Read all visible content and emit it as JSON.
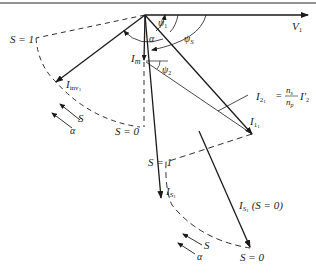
{
  "diagram": {
    "type": "phasor-diagram",
    "colors": {
      "stroke": "#1a1a1a",
      "frame": "#6e6e6e",
      "background": "#ffffff"
    },
    "labels": {
      "v1": "V",
      "v1_sub": "1",
      "s1_top": "S = 1",
      "i_inv": "I",
      "i_inv_sub": "inv",
      "i_inv_sub2": "1",
      "i_m": "I",
      "i_m_sub": "m",
      "alpha_top": "α",
      "psi1": "ψ",
      "psi1_sub": "1",
      "psis": "ψ",
      "psis_sub": "S",
      "psi2": "ψ",
      "psi2_sub": "2",
      "s0_upper": "S = 0",
      "i2_lhs": "I",
      "i2_lhs_sub": "2",
      "i2_lhs_sub2": "1",
      "i2_eq": "=",
      "i2_num": "n",
      "i2_num_sub": "s",
      "i2_den": "n",
      "i2_den_sub": "p",
      "i2_rhs": "I′",
      "i2_rhs_sub": "2",
      "i2_rhs_sub2": "1",
      "i11": "I",
      "i11_sub": "1",
      "i11_sub2": "1",
      "s1_mid": "S = 1",
      "is1": "I",
      "is1_sub": "S",
      "is1_sub2": "1",
      "is1_s0": "I",
      "is1_s0_sub": "S",
      "is1_s0_sub2": "1",
      "is1_s0_cond": "(S = 0)",
      "s0_bottom": "S = 0",
      "arc_left_s": "S",
      "arc_left_alpha": "α",
      "arc_bottom_s": "S",
      "arc_bottom_alpha": "α"
    }
  }
}
